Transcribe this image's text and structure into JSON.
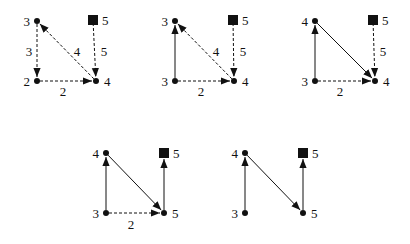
{
  "colors": {
    "ink": "#111111",
    "background": "#ffffff"
  },
  "diagrams": [
    {
      "id": "d1",
      "nodes": [
        {
          "key": "tl",
          "x": 37,
          "y": 21,
          "shape": "dot",
          "label": "3",
          "label_side": "left"
        },
        {
          "key": "tr",
          "x": 93,
          "y": 20,
          "shape": "square",
          "label": "5",
          "label_side": "right"
        },
        {
          "key": "bl",
          "x": 37,
          "y": 81,
          "shape": "dot",
          "label": "2",
          "label_side": "left"
        },
        {
          "key": "br",
          "x": 96,
          "y": 81,
          "shape": "dot",
          "label": "4",
          "label_side": "right"
        }
      ],
      "edges": [
        {
          "from": "tl",
          "to": "bl",
          "style": "dashed",
          "label": "3",
          "lx": 29,
          "ly": 56
        },
        {
          "from": "br",
          "to": "tl",
          "style": "dashed",
          "label": "4",
          "lx": 77,
          "ly": 56
        },
        {
          "from": "tr",
          "to": "br",
          "style": "dashed",
          "label": "5",
          "lx": 104,
          "ly": 56
        },
        {
          "from": "bl",
          "to": "br",
          "style": "dashed",
          "label": "2",
          "lx": 63,
          "ly": 96
        }
      ]
    },
    {
      "id": "d2",
      "nodes": [
        {
          "key": "tl",
          "x": 175,
          "y": 21,
          "shape": "dot",
          "label": "3",
          "label_side": "left"
        },
        {
          "key": "tr",
          "x": 233,
          "y": 20,
          "shape": "square",
          "label": "5",
          "label_side": "right"
        },
        {
          "key": "bl",
          "x": 175,
          "y": 81,
          "shape": "dot",
          "label": "3",
          "label_side": "left"
        },
        {
          "key": "br",
          "x": 234,
          "y": 81,
          "shape": "dot",
          "label": "4",
          "label_side": "right"
        }
      ],
      "edges": [
        {
          "from": "bl",
          "to": "tl",
          "style": "solid",
          "label": "",
          "lx": 0,
          "ly": 0
        },
        {
          "from": "br",
          "to": "tl",
          "style": "dashed",
          "label": "4",
          "lx": 216,
          "ly": 56
        },
        {
          "from": "tr",
          "to": "br",
          "style": "dashed",
          "label": "5",
          "lx": 243,
          "ly": 56
        },
        {
          "from": "bl",
          "to": "br",
          "style": "dashed",
          "label": "2",
          "lx": 201,
          "ly": 96
        }
      ]
    },
    {
      "id": "d3",
      "nodes": [
        {
          "key": "tl",
          "x": 315,
          "y": 21,
          "shape": "dot",
          "label": "4",
          "label_side": "left"
        },
        {
          "key": "tr",
          "x": 373,
          "y": 20,
          "shape": "square",
          "label": "5",
          "label_side": "right"
        },
        {
          "key": "bl",
          "x": 315,
          "y": 81,
          "shape": "dot",
          "label": "3",
          "label_side": "left"
        },
        {
          "key": "br",
          "x": 375,
          "y": 81,
          "shape": "dot",
          "label": "4",
          "label_side": "right"
        }
      ],
      "edges": [
        {
          "from": "bl",
          "to": "tl",
          "style": "solid",
          "label": "",
          "lx": 0,
          "ly": 0
        },
        {
          "from": "tl",
          "to": "br",
          "style": "solid",
          "label": "",
          "lx": 0,
          "ly": 0
        },
        {
          "from": "tr",
          "to": "br",
          "style": "dashed",
          "label": "5",
          "lx": 383,
          "ly": 56
        },
        {
          "from": "bl",
          "to": "br",
          "style": "dashed",
          "label": "2",
          "lx": 340,
          "ly": 96
        }
      ]
    },
    {
      "id": "d4",
      "nodes": [
        {
          "key": "tl",
          "x": 106,
          "y": 153,
          "shape": "dot",
          "label": "4",
          "label_side": "left"
        },
        {
          "key": "tr",
          "x": 164,
          "y": 153,
          "shape": "square",
          "label": "5",
          "label_side": "right"
        },
        {
          "key": "bl",
          "x": 106,
          "y": 213,
          "shape": "dot",
          "label": "3",
          "label_side": "left"
        },
        {
          "key": "br",
          "x": 164,
          "y": 213,
          "shape": "dot",
          "label": "5",
          "label_side": "right"
        }
      ],
      "edges": [
        {
          "from": "bl",
          "to": "tl",
          "style": "solid",
          "label": "",
          "lx": 0,
          "ly": 0
        },
        {
          "from": "tl",
          "to": "br",
          "style": "solid",
          "label": "",
          "lx": 0,
          "ly": 0
        },
        {
          "from": "br",
          "to": "tr",
          "style": "solid",
          "label": "",
          "lx": 0,
          "ly": 0
        },
        {
          "from": "bl",
          "to": "br",
          "style": "dashed",
          "label": "2",
          "lx": 131,
          "ly": 229
        }
      ]
    },
    {
      "id": "d5",
      "nodes": [
        {
          "key": "tl",
          "x": 245,
          "y": 153,
          "shape": "dot",
          "label": "4",
          "label_side": "left"
        },
        {
          "key": "tr",
          "x": 303,
          "y": 153,
          "shape": "square",
          "label": "5",
          "label_side": "right"
        },
        {
          "key": "bl",
          "x": 245,
          "y": 213,
          "shape": "dot",
          "label": "3",
          "label_side": "left"
        },
        {
          "key": "br",
          "x": 303,
          "y": 213,
          "shape": "dot",
          "label": "5",
          "label_side": "right"
        }
      ],
      "edges": [
        {
          "from": "bl",
          "to": "tl",
          "style": "solid",
          "label": "",
          "lx": 0,
          "ly": 0
        },
        {
          "from": "tl",
          "to": "br",
          "style": "solid",
          "label": "",
          "lx": 0,
          "ly": 0
        },
        {
          "from": "br",
          "to": "tr",
          "style": "solid",
          "label": "",
          "lx": 0,
          "ly": 0
        }
      ]
    }
  ]
}
